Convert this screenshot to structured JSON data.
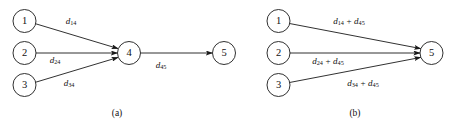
{
  "figure": {
    "width": 453,
    "height": 129,
    "background": "#ffffff",
    "stroke_color": "#1a1a1a",
    "text_color": "#111111"
  },
  "panels": [
    {
      "id": "panel-a",
      "caption": "(a)",
      "caption_pos": {
        "x": 117,
        "y": 114
      },
      "nodes": [
        {
          "id": "a-n1",
          "label": "1",
          "cx": 24.5,
          "cy": 21,
          "r": 11.5
        },
        {
          "id": "a-n2",
          "label": "2",
          "cx": 24.5,
          "cy": 53,
          "r": 11.5
        },
        {
          "id": "a-n3",
          "label": "3",
          "cx": 24.5,
          "cy": 85,
          "r": 11.5
        },
        {
          "id": "a-n4",
          "label": "4",
          "cx": 129,
          "cy": 53,
          "r": 11.5
        },
        {
          "id": "a-n5",
          "label": "5",
          "cx": 224,
          "cy": 53,
          "r": 11.5
        }
      ],
      "edges": [
        {
          "id": "a-e14",
          "from": "a-n1",
          "to": "a-n4",
          "x1": 35.4,
          "y1": 23.7,
          "x2": 118.2,
          "y2": 48.6,
          "label_main": "d",
          "label_sub": "14",
          "label_x": 71,
          "label_y": 22
        },
        {
          "id": "a-e24",
          "from": "a-n2",
          "to": "a-n4",
          "x1": 36,
          "y1": 53,
          "x2": 117.5,
          "y2": 53,
          "label_main": "d",
          "label_sub": "24",
          "label_x": 55,
          "label_y": 61
        },
        {
          "id": "a-e34",
          "from": "a-n3",
          "to": "a-n4",
          "x1": 35.4,
          "y1": 82.3,
          "x2": 118.2,
          "y2": 57.4,
          "label_main": "d",
          "label_sub": "34",
          "label_x": 69,
          "label_y": 84
        },
        {
          "id": "a-e45",
          "from": "a-n4",
          "to": "a-n5",
          "x1": 140.5,
          "y1": 53,
          "x2": 212.5,
          "y2": 53,
          "label_main": "d",
          "label_sub": "45",
          "label_x": 161,
          "label_y": 66
        }
      ]
    },
    {
      "id": "panel-b",
      "caption": "(b)",
      "caption_pos": {
        "x": 355,
        "y": 114
      },
      "nodes": [
        {
          "id": "b-n1",
          "label": "1",
          "cx": 278.5,
          "cy": 21,
          "r": 11.5
        },
        {
          "id": "b-n2",
          "label": "2",
          "cx": 278.5,
          "cy": 53,
          "r": 11.5
        },
        {
          "id": "b-n3",
          "label": "3",
          "cx": 278.5,
          "cy": 85,
          "r": 11.5
        },
        {
          "id": "b-n5",
          "label": "5",
          "cx": 431.5,
          "cy": 53,
          "r": 11.5
        }
      ],
      "edges": [
        {
          "id": "b-e15",
          "from": "b-n1",
          "to": "b-n5",
          "x1": 289.5,
          "y1": 23.5,
          "x2": 420.8,
          "y2": 48.6,
          "label_main_1": "d",
          "label_sub_1": "14",
          "label_op": "+",
          "label_main_2": "d",
          "label_sub_2": "45",
          "label_x": 349,
          "label_y": 22
        },
        {
          "id": "b-e25",
          "from": "b-n2",
          "to": "b-n5",
          "x1": 290,
          "y1": 53,
          "x2": 420,
          "y2": 53,
          "label_main_1": "d",
          "label_sub_1": "24",
          "label_op": "+",
          "label_main_2": "d",
          "label_sub_2": "45",
          "label_x": 328,
          "label_y": 62
        },
        {
          "id": "b-e35",
          "from": "b-n3",
          "to": "b-n5",
          "x1": 289.5,
          "y1": 82.5,
          "x2": 420.8,
          "y2": 57.4,
          "label_main_1": "d",
          "label_sub_1": "34",
          "label_op": "+",
          "label_main_2": "d",
          "label_sub_2": "45",
          "label_x": 363,
          "label_y": 84
        }
      ]
    }
  ]
}
